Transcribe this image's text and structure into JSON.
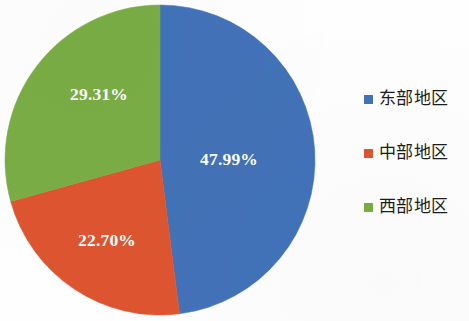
{
  "chart_data": {
    "type": "pie",
    "title": "",
    "subtitle": "",
    "xlabel": "",
    "ylabel": "",
    "grid": false,
    "legend_position": "right",
    "start_angle_deg": 0,
    "direction": "clockwise",
    "categories": [
      "东部地区",
      "中部地区",
      "西部地区"
    ],
    "values": [
      47.99,
      22.7,
      29.31
    ],
    "value_unit": "%",
    "data_labels": [
      "47.99%",
      "22.70%",
      "29.31%"
    ],
    "colors": [
      "#4272b8",
      "#dd5530",
      "#7aad45"
    ],
    "slices": [
      {
        "name": "东部地区",
        "value": 47.99,
        "label": "47.99%",
        "color": "#4272b8",
        "label_x": 200,
        "label_y": 165
      },
      {
        "name": "中部地区",
        "value": 22.7,
        "label": "22.70%",
        "color": "#dd5530",
        "label_x": 78,
        "label_y": 246
      },
      {
        "name": "西部地区",
        "value": 29.31,
        "label": "29.31%",
        "color": "#7aad45",
        "label_x": 70,
        "label_y": 100
      }
    ]
  },
  "legend": {
    "items": [
      {
        "label": "东部地区",
        "color": "#4272b8"
      },
      {
        "label": "中部地区",
        "color": "#dd5530"
      },
      {
        "label": "西部地区",
        "color": "#7aad45"
      }
    ]
  }
}
